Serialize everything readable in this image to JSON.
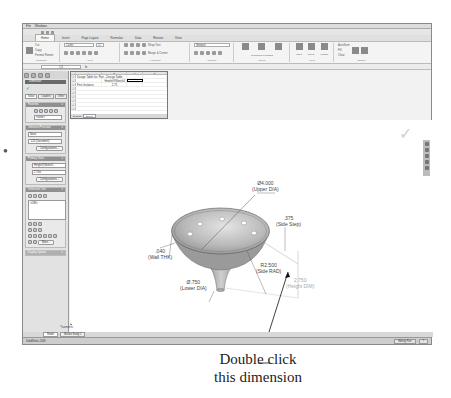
{
  "window": {
    "title": "Windows",
    "menu_file": "File"
  },
  "ribbon": {
    "tabs": [
      "Home",
      "Insert",
      "Page Layout",
      "Formulas",
      "Data",
      "Review",
      "View"
    ],
    "active_tab": "Home",
    "clipboard": {
      "paste": "Paste",
      "cut": "Cut",
      "copy": "Copy",
      "format_painter": "Format Painter",
      "label": "Clipboard"
    },
    "font": {
      "name": "Calibri",
      "size": "11",
      "label": "Font"
    },
    "alignment": {
      "wrap_text": "Wrap Text",
      "merge": "Merge & Center",
      "label": "Alignment"
    },
    "number": {
      "format": "General",
      "label": "Number"
    },
    "styles": {
      "conditional": "Conditional Formatting",
      "format_table": "Format as Table",
      "cell_styles": "Cell Styles",
      "label": "Styles"
    },
    "cells": {
      "insert": "Insert",
      "delete": "Delete",
      "format": "Format",
      "label": "Cells"
    },
    "editing": {
      "autosum": "AutoSum",
      "fill": "Fill",
      "clear": "Clear",
      "sort": "Sort & Filter",
      "find": "Find & Select",
      "label": "Editing"
    }
  },
  "formula_bar": {
    "name_box": "C3"
  },
  "left_panel": {
    "header": "Dimension",
    "tabs": [
      "Value",
      "Leaders",
      "Other"
    ],
    "favorites": {
      "title": "Favorites",
      "select": "<none>"
    },
    "tolerance": {
      "title": "Tolerance/Precision",
      "type": "None",
      "precision": ".123 (Document)",
      "config_button": "Configurations..."
    },
    "primary_value": {
      "title": "Primary Value",
      "name": "Height@Sketch1",
      "value": "2.75in",
      "config_button": "Configurations..."
    },
    "dimension_text": {
      "title": "Dimension Text",
      "text": "<DIM>"
    },
    "more_button": "More...",
    "display_options": "Display Options"
  },
  "spreadsheet": {
    "columns": [
      "A",
      "B",
      "C",
      "D"
    ],
    "rows": [
      {
        "num": "1",
        "cells": [
          "Design Table for: Part - Design Table",
          "",
          "",
          ""
        ]
      },
      {
        "num": "2",
        "cells": [
          "",
          "Height@Sketch1",
          "",
          ""
        ]
      },
      {
        "num": "3",
        "cells": [
          "First Instance",
          "2.75",
          "",
          ""
        ]
      },
      {
        "num": "4",
        "cells": [
          "",
          "",
          "",
          ""
        ]
      },
      {
        "num": "5",
        "cells": [
          "",
          "",
          "",
          ""
        ]
      },
      {
        "num": "6",
        "cells": [
          "",
          "",
          "",
          ""
        ]
      },
      {
        "num": "7",
        "cells": [
          "",
          "",
          "",
          ""
        ]
      },
      {
        "num": "8",
        "cells": [
          "",
          "",
          "",
          ""
        ]
      },
      {
        "num": "9",
        "cells": [
          "",
          "",
          "",
          ""
        ]
      },
      {
        "num": "10",
        "cells": [
          "",
          "",
          "",
          ""
        ]
      }
    ],
    "sheet_tab": "Sheet1"
  },
  "dimensions": {
    "upper_dia": {
      "value": "Ø4.000",
      "label": "(Upper DIA)"
    },
    "side_step": {
      "value": ".375",
      "label": "(Side Step)"
    },
    "side_rad": {
      "value": "R2.500",
      "label": "(Side RAD)"
    },
    "wall_thk": {
      "value": ".040",
      "label": "(Wall THK)"
    },
    "lower_dia": {
      "value": "Ø.750",
      "label": "(Lower DIA)"
    },
    "height_dim": {
      "value": "2.750",
      "label": "(Height DIM)"
    }
  },
  "view_label": "*Isometric",
  "model_tabs": [
    "Model",
    "Motion Study 1"
  ],
  "status_bar": {
    "left": "SolidWorks 2009",
    "editing": "Editing Part"
  },
  "callout": {
    "line1": "Double click",
    "line2": "this dimension"
  }
}
